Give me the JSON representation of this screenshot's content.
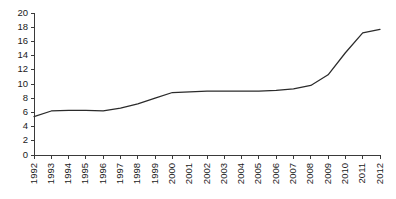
{
  "chart_data": {
    "type": "line",
    "title": "",
    "subtitle": "",
    "xlabel": "",
    "ylabel": "",
    "categories": [
      "1992",
      "1993",
      "1994",
      "1995",
      "1996",
      "1997",
      "1998",
      "1999",
      "2000",
      "2001",
      "2002",
      "2003",
      "2004",
      "2005",
      "2006",
      "2007",
      "2008",
      "2009",
      "2010",
      "2011",
      "2012"
    ],
    "values": [
      5.4,
      6.2,
      6.3,
      6.3,
      6.2,
      6.6,
      7.2,
      8.0,
      8.8,
      8.9,
      9.0,
      9.0,
      9.0,
      9.0,
      9.1,
      9.3,
      9.8,
      11.3,
      14.4,
      17.2,
      17.7
    ],
    "series": [
      {
        "name": "series-1",
        "values": [
          5.4,
          6.2,
          6.3,
          6.3,
          6.2,
          6.6,
          7.2,
          8.0,
          8.8,
          8.9,
          9.0,
          9.0,
          9.0,
          9.0,
          9.1,
          9.3,
          9.8,
          11.3,
          14.4,
          17.2,
          17.7
        ],
        "color": "#2b2b2b"
      }
    ],
    "ylim": [
      0,
      20
    ],
    "yticks": [
      0,
      2,
      4,
      6,
      8,
      10,
      12,
      14,
      16,
      18,
      20
    ],
    "ytick_labels": [
      "0",
      "2",
      "4",
      "6",
      "8",
      "10",
      "12",
      "14",
      "16",
      "18",
      "20"
    ],
    "xtick_labels": [
      "1992",
      "1993",
      "1994",
      "1995",
      "1996",
      "1997",
      "1998",
      "1999",
      "2000",
      "2001",
      "2002",
      "2003",
      "2004",
      "2005",
      "2006",
      "2007",
      "2008",
      "2009",
      "2010",
      "2011",
      "2012"
    ],
    "xtick_rotation": -90,
    "grid": false,
    "legend": false,
    "legend_position": "none",
    "line_color": "#2b2b2b",
    "axis_color": "#3a3a3a",
    "background_color": "#ffffff"
  }
}
